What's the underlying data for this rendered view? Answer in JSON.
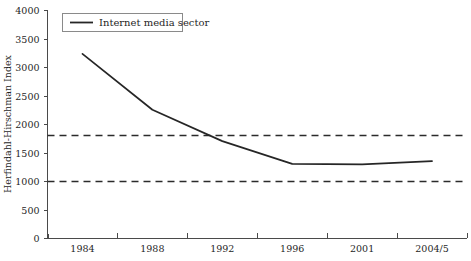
{
  "chart_data": {
    "type": "line",
    "title": "",
    "xlabel": "",
    "ylabel": "Herfindahl-Hirschman Index",
    "categories": [
      "1984",
      "1988",
      "1992",
      "1996",
      "2001",
      "2004/5"
    ],
    "series": [
      {
        "name": "Internet media sector",
        "values": [
          3230,
          2250,
          1700,
          1300,
          1290,
          1350
        ],
        "color": "#262626"
      }
    ],
    "ylim": [
      0,
      4000
    ],
    "yticks": [
      0,
      500,
      1000,
      1500,
      2000,
      2500,
      3000,
      3500,
      4000
    ],
    "ytick_labels": [
      "0",
      "500",
      "1000",
      "1500",
      "2000",
      "2500",
      "3000",
      "3500",
      "4000"
    ],
    "grid": false,
    "legend": {
      "position": "top-left",
      "entries": [
        {
          "label": "Internet media sector",
          "marker": "line",
          "color": "#262626"
        }
      ]
    },
    "reference_lines": [
      {
        "name": "upper-threshold",
        "value": 1800,
        "style": "dashed",
        "color": "#2b2b2b"
      },
      {
        "name": "lower-threshold",
        "value": 1000,
        "style": "dashed",
        "color": "#2b2b2b"
      }
    ]
  },
  "colors": {
    "background": "#ffffff",
    "axis": "#4a4a4a",
    "series": "#262626",
    "threshold": "#2b2b2b",
    "text": "#1f1f1f"
  }
}
